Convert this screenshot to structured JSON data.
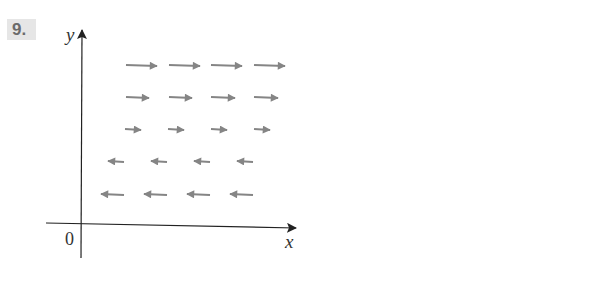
{
  "problem": {
    "number": "9."
  },
  "axes": {
    "x_label": "x",
    "y_label": "y",
    "origin_label": "0",
    "color": "#222222"
  },
  "vector_field": {
    "arrow_color": "#858585",
    "description": "Horizontal vector field: upper three rows point right with length increasing upward; lower two rows point left with length increasing downward",
    "rows": [
      {
        "y": 65,
        "direction": "right",
        "arrows": [
          [
            126,
            157
          ],
          [
            169,
            200
          ],
          [
            211,
            242
          ],
          [
            254,
            285
          ]
        ]
      },
      {
        "y": 97,
        "direction": "right",
        "arrows": [
          [
            126,
            149
          ],
          [
            169,
            192
          ],
          [
            211,
            235
          ],
          [
            254,
            278
          ]
        ]
      },
      {
        "y": 129,
        "direction": "right",
        "arrows": [
          [
            125,
            141
          ],
          [
            168,
            184
          ],
          [
            211,
            227
          ],
          [
            254,
            270
          ]
        ]
      },
      {
        "y": 161,
        "direction": "left",
        "arrows": [
          [
            108,
            124
          ],
          [
            151,
            167
          ],
          [
            194,
            210
          ],
          [
            237,
            253
          ]
        ]
      },
      {
        "y": 194,
        "direction": "left",
        "arrows": [
          [
            101,
            124
          ],
          [
            144,
            167
          ],
          [
            187,
            210
          ],
          [
            230,
            253
          ]
        ]
      }
    ]
  }
}
